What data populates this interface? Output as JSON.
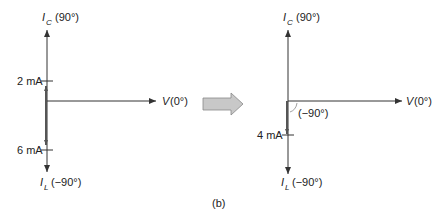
{
  "figure": {
    "caption": "(b)",
    "arrow_color": "#c8c8c8",
    "axis_color": "#333333",
    "phasor_color": "#555555"
  },
  "left_diagram": {
    "axis_top_label": {
      "main": "I",
      "sub": "C",
      "angle": "(90°)"
    },
    "axis_bottom_label": {
      "main": "I",
      "sub": "L",
      "angle": "(−90°)"
    },
    "axis_right_label": {
      "main": "V",
      "angle": "(0°)"
    },
    "ticks": [
      {
        "label": "2 mA",
        "position": "above"
      },
      {
        "label": "6 mA",
        "position": "below"
      }
    ]
  },
  "right_diagram": {
    "axis_top_label": {
      "main": "I",
      "sub": "C",
      "angle": "(90°)"
    },
    "axis_bottom_label": {
      "main": "I",
      "sub": "L",
      "angle": "(−90°)"
    },
    "axis_right_label": {
      "main": "V",
      "angle": "(0°)"
    },
    "ticks": [
      {
        "label": "4 mA",
        "position": "below"
      }
    ],
    "angle_label": "(−90°)"
  }
}
